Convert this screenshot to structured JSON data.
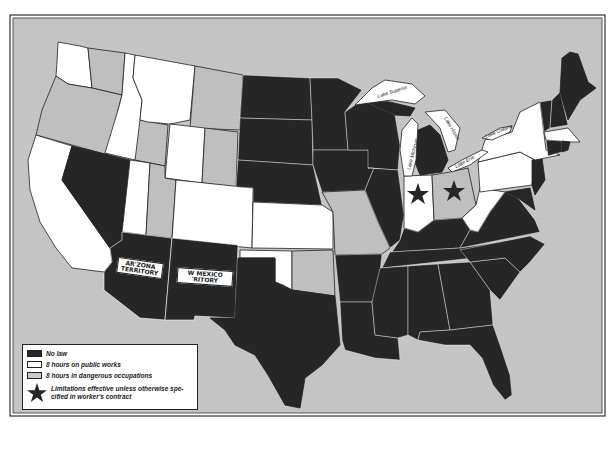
{
  "map": {
    "subject": "Hours-of-labor laws by state",
    "colors": {
      "no_law": "#262626",
      "public_works": "#ffffff",
      "dangerous": "#c9c9c9",
      "water": "#c4c4c4",
      "border": "#222222"
    },
    "territory_labels": {
      "arizona_line1": "AR'ZONA",
      "arizona_line2": "TERRITORY",
      "new_mexico_line1": "W MEXICO",
      "new_mexico_line2": "'RITORY"
    },
    "lake_labels": {
      "superior": "Lake Superior",
      "michigan": "Lake Michigan",
      "huron": "Lake Huron",
      "erie": "Lake Erie",
      "ontario": "Lake Ontario"
    },
    "states": [
      {
        "name": "Washington (west)",
        "category": "public_works"
      },
      {
        "name": "Washington (east)",
        "category": "dangerous"
      },
      {
        "name": "Oregon",
        "category": "dangerous"
      },
      {
        "name": "California",
        "category": "public_works"
      },
      {
        "name": "Nevada",
        "category": "no_law"
      },
      {
        "name": "Idaho (north)",
        "category": "public_works"
      },
      {
        "name": "Idaho (south)",
        "category": "dangerous"
      },
      {
        "name": "Montana (west)",
        "category": "public_works"
      },
      {
        "name": "Montana (east)",
        "category": "dangerous"
      },
      {
        "name": "Wyoming (west)",
        "category": "public_works"
      },
      {
        "name": "Wyoming (east)",
        "category": "dangerous"
      },
      {
        "name": "Utah (west)",
        "category": "public_works"
      },
      {
        "name": "Utah (east)",
        "category": "dangerous"
      },
      {
        "name": "Colorado",
        "category": "public_works"
      },
      {
        "name": "Arizona Territory",
        "category": "no_law"
      },
      {
        "name": "New Mexico Territory",
        "category": "no_law"
      },
      {
        "name": "North Dakota",
        "category": "no_law"
      },
      {
        "name": "South Dakota",
        "category": "no_law"
      },
      {
        "name": "Nebraska",
        "category": "no_law"
      },
      {
        "name": "Kansas",
        "category": "public_works"
      },
      {
        "name": "Oklahoma (west)",
        "category": "public_works"
      },
      {
        "name": "Oklahoma (east)",
        "category": "dangerous"
      },
      {
        "name": "Texas",
        "category": "no_law"
      },
      {
        "name": "Minnesota",
        "category": "no_law"
      },
      {
        "name": "Iowa",
        "category": "no_law"
      },
      {
        "name": "Missouri",
        "category": "dangerous"
      },
      {
        "name": "Arkansas",
        "category": "no_law"
      },
      {
        "name": "Louisiana",
        "category": "no_law"
      },
      {
        "name": "Wisconsin",
        "category": "no_law"
      },
      {
        "name": "Illinois",
        "category": "no_law"
      },
      {
        "name": "Michigan",
        "category": "no_law"
      },
      {
        "name": "Indiana",
        "category": "public_works",
        "star": true
      },
      {
        "name": "Ohio",
        "category": "dangerous",
        "star": true
      },
      {
        "name": "Kentucky",
        "category": "no_law"
      },
      {
        "name": "Tennessee",
        "category": "no_law"
      },
      {
        "name": "Mississippi",
        "category": "no_law"
      },
      {
        "name": "Alabama",
        "category": "no_law"
      },
      {
        "name": "Georgia",
        "category": "no_law"
      },
      {
        "name": "Florida",
        "category": "no_law"
      },
      {
        "name": "South Carolina",
        "category": "no_law"
      },
      {
        "name": "North Carolina",
        "category": "no_law"
      },
      {
        "name": "Virginia",
        "category": "no_law"
      },
      {
        "name": "West Virginia",
        "category": "public_works"
      },
      {
        "name": "Maryland",
        "category": "no_law"
      },
      {
        "name": "Delaware",
        "category": "no_law"
      },
      {
        "name": "Pennsylvania",
        "category": "public_works"
      },
      {
        "name": "New Jersey",
        "category": "no_law"
      },
      {
        "name": "New York",
        "category": "public_works"
      },
      {
        "name": "Connecticut",
        "category": "no_law"
      },
      {
        "name": "Rhode Island",
        "category": "no_law"
      },
      {
        "name": "Massachusetts",
        "category": "public_works"
      },
      {
        "name": "Vermont",
        "category": "no_law"
      },
      {
        "name": "New Hampshire",
        "category": "no_law"
      },
      {
        "name": "Maine",
        "category": "no_law"
      }
    ]
  },
  "legend": {
    "items": [
      {
        "key": "no_law",
        "label": "No law"
      },
      {
        "key": "public_works",
        "label": "8 hours on public works"
      },
      {
        "key": "dangerous",
        "label": "8 hours in dangerous occupations"
      }
    ],
    "star_label": "Limitations effective unless otherwise spe-cified in worker's contract"
  }
}
